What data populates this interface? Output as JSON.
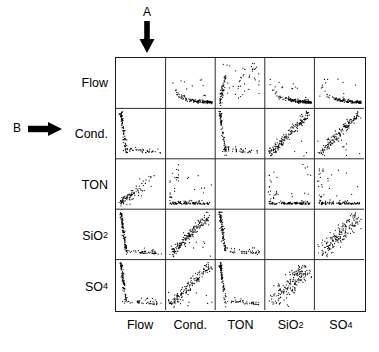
{
  "figure": {
    "type": "scatterplot-matrix",
    "background_color": "#ffffff",
    "line_color": "#1a1a1a",
    "point_color": "#000000"
  },
  "annotations": [
    {
      "id": "a",
      "label": "A",
      "arrow": "down-arrow-icon",
      "points_to": "column-flow"
    },
    {
      "id": "b",
      "label": "B",
      "arrow": "right-arrow-icon",
      "points_to": "row-cond"
    }
  ],
  "variables": [
    {
      "key": "flow",
      "label": "Flow",
      "base": "Flow",
      "sub": ""
    },
    {
      "key": "cond",
      "label": "Cond.",
      "base": "Cond.",
      "sub": ""
    },
    {
      "key": "ton",
      "label": "TON",
      "base": "TON",
      "sub": ""
    },
    {
      "key": "sio2",
      "label": "SiO2",
      "base": "SiO",
      "sub": "2"
    },
    {
      "key": "so4",
      "label": "SO4",
      "base": "SO",
      "sub": "4"
    }
  ],
  "row_labels": [
    {
      "base": "Flow",
      "sub": ""
    },
    {
      "base": "Cond.",
      "sub": ""
    },
    {
      "base": "TON",
      "sub": ""
    },
    {
      "base": "SiO",
      "sub": "2"
    },
    {
      "base": "SO",
      "sub": "4"
    }
  ],
  "col_labels": [
    {
      "base": "Flow",
      "sub": ""
    },
    {
      "base": "Cond.",
      "sub": ""
    },
    {
      "base": "TON",
      "sub": ""
    },
    {
      "base": "SiO",
      "sub": "2"
    },
    {
      "base": "SO",
      "sub": "4"
    }
  ],
  "chart_data": {
    "type": "scatter",
    "title": "",
    "subtitle": "",
    "xlabel": "",
    "ylabel": "",
    "grid": true,
    "legend_position": "none",
    "matrix_size": 5,
    "diagonal_empty": true,
    "variables": [
      "Flow",
      "Cond.",
      "TON",
      "SiO2",
      "SO4"
    ],
    "panels": [
      {
        "row": "Flow",
        "col": "Flow",
        "pattern": "empty",
        "n": 0
      },
      {
        "row": "Flow",
        "col": "Cond.",
        "pattern": "inverse-hyperbola",
        "n": 120,
        "correlation": -0.72
      },
      {
        "row": "Flow",
        "col": "TON",
        "pattern": "rising-left-edge",
        "n": 100,
        "correlation": -0.35
      },
      {
        "row": "Flow",
        "col": "SiO2",
        "pattern": "inverse-hyperbola",
        "n": 150,
        "correlation": -0.6
      },
      {
        "row": "Flow",
        "col": "SO4",
        "pattern": "inverse-hyperbola",
        "n": 120,
        "correlation": -0.7
      },
      {
        "row": "Cond.",
        "col": "Flow",
        "pattern": "inverse-vertical",
        "n": 120,
        "correlation": -0.72
      },
      {
        "row": "Cond.",
        "col": "Cond.",
        "pattern": "empty",
        "n": 0
      },
      {
        "row": "Cond.",
        "col": "TON",
        "pattern": "inverse-vertical",
        "n": 110,
        "correlation": -0.45
      },
      {
        "row": "Cond.",
        "col": "SiO2",
        "pattern": "positive-band",
        "n": 160,
        "correlation": 0.88
      },
      {
        "row": "Cond.",
        "col": "SO4",
        "pattern": "positive-band",
        "n": 150,
        "correlation": 0.9
      },
      {
        "row": "TON",
        "col": "Flow",
        "pattern": "rising-bottom-left",
        "n": 90,
        "correlation": 0.3
      },
      {
        "row": "TON",
        "col": "Cond.",
        "pattern": "bottom-axis-hug",
        "n": 120,
        "correlation": -0.2
      },
      {
        "row": "TON",
        "col": "TON",
        "pattern": "empty",
        "n": 0
      },
      {
        "row": "TON",
        "col": "SiO2",
        "pattern": "bottom-axis-hug",
        "n": 130,
        "correlation": -0.15
      },
      {
        "row": "TON",
        "col": "SO4",
        "pattern": "bottom-axis-hug",
        "n": 120,
        "correlation": -0.18
      },
      {
        "row": "SiO2",
        "col": "Flow",
        "pattern": "inverse-vertical",
        "n": 140,
        "correlation": -0.6
      },
      {
        "row": "SiO2",
        "col": "Cond.",
        "pattern": "positive-band",
        "n": 160,
        "correlation": 0.88
      },
      {
        "row": "SiO2",
        "col": "TON",
        "pattern": "inverse-vertical",
        "n": 130,
        "correlation": -0.4
      },
      {
        "row": "SiO2",
        "col": "SiO2",
        "pattern": "empty",
        "n": 0
      },
      {
        "row": "SiO2",
        "col": "SO4",
        "pattern": "positive-cloud",
        "n": 170,
        "correlation": 0.78
      },
      {
        "row": "SO4",
        "col": "Flow",
        "pattern": "inverse-vertical",
        "n": 120,
        "correlation": -0.7
      },
      {
        "row": "SO4",
        "col": "Cond.",
        "pattern": "positive-band",
        "n": 150,
        "correlation": 0.9
      },
      {
        "row": "SO4",
        "col": "TON",
        "pattern": "inverse-vertical",
        "n": 120,
        "correlation": -0.42
      },
      {
        "row": "SO4",
        "col": "SiO2",
        "pattern": "positive-cloud",
        "n": 170,
        "correlation": 0.78
      },
      {
        "row": "SO4",
        "col": "SO4",
        "pattern": "empty",
        "n": 0
      }
    ]
  }
}
